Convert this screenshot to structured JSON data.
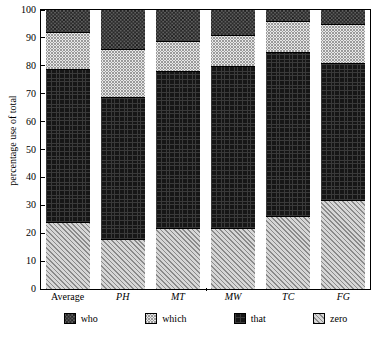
{
  "chart_data": {
    "type": "bar",
    "subtype": "stacked-percentage",
    "title": "",
    "xlabel": "",
    "ylabel": "percentage use of total",
    "ylim": [
      0,
      100
    ],
    "yticks": [
      0,
      10,
      20,
      30,
      40,
      50,
      60,
      70,
      80,
      90,
      100
    ],
    "grid": false,
    "legend_position": "bottom",
    "categories": [
      "Average",
      "PH",
      "MT",
      "MW",
      "TC",
      "FG"
    ],
    "series": [
      {
        "name": "zero",
        "values": [
          24,
          18,
          22,
          22,
          26,
          32
        ]
      },
      {
        "name": "that",
        "values": [
          55,
          51,
          56,
          58,
          59,
          49
        ]
      },
      {
        "name": "which",
        "values": [
          13,
          17,
          11,
          11,
          11,
          14
        ]
      },
      {
        "name": "who",
        "values": [
          8,
          14,
          11,
          9,
          4,
          5
        ]
      }
    ],
    "cumulative_tops": {
      "Average": {
        "zero": 24,
        "that": 79,
        "which": 92,
        "who": 100
      },
      "PH": {
        "zero": 18,
        "that": 69,
        "which": 86,
        "who": 100
      },
      "MT": {
        "zero": 22,
        "that": 78,
        "which": 89,
        "who": 100
      },
      "MW": {
        "zero": 22,
        "that": 80,
        "which": 91,
        "who": 100
      },
      "TC": {
        "zero": 26,
        "that": 85,
        "which": 96,
        "who": 100
      },
      "FG": {
        "zero": 32,
        "that": 81,
        "which": 95,
        "who": 100
      }
    }
  },
  "axes": {
    "y_title": "percentage use of total",
    "y_tick_labels": [
      "100",
      "90",
      "80",
      "70",
      "60",
      "50",
      "40",
      "30",
      "20",
      "10",
      "0"
    ],
    "x_tick_labels": [
      "Average",
      "PH",
      "MT",
      "MW",
      "TC",
      "FG"
    ],
    "x_label_italic": [
      false,
      true,
      true,
      true,
      true,
      true
    ]
  },
  "legend": {
    "items": [
      {
        "label": "who",
        "pattern": "dark-crosshatch"
      },
      {
        "label": "which",
        "pattern": "light-checker"
      },
      {
        "label": "that",
        "pattern": "solid-black"
      },
      {
        "label": "zero",
        "pattern": "diagonal-hatch"
      }
    ]
  }
}
